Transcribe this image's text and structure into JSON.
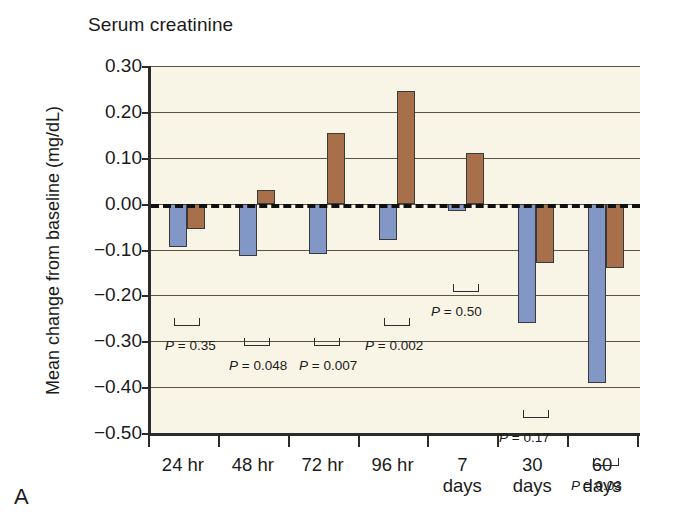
{
  "figure": {
    "panel_letter": "A",
    "title": "Serum creatinine",
    "ylabel": "Mean change from baseline (mg/dL)"
  },
  "colors": {
    "series_blue": "#8397c6",
    "series_brown": "#a8704a",
    "plot_background": "#f8f5e6",
    "axis": "#2b2b2b",
    "gridline": "#5c5243"
  },
  "chart_data": {
    "type": "bar",
    "title": "Serum creatinine",
    "xlabel": "",
    "ylabel": "Mean change from baseline (mg/dL)",
    "ylim": [
      -0.5,
      0.3
    ],
    "yticks": [
      "0.30",
      "0.20",
      "0.10",
      "0.00",
      "−0.10",
      "−0.20",
      "−0.30",
      "−0.40",
      "−0.50"
    ],
    "ytick_values": [
      0.3,
      0.2,
      0.1,
      0.0,
      -0.1,
      -0.2,
      -0.3,
      -0.4,
      -0.5
    ],
    "grid": true,
    "zero_reference_line": 0.0,
    "legend_position": "none",
    "categories": [
      "24 hr",
      "48 hr",
      "72 hr",
      "96 hr",
      "7 days",
      "30 days",
      "60 days"
    ],
    "series": [
      {
        "name": "series-blue",
        "values": [
          -0.095,
          -0.115,
          -0.11,
          -0.08,
          -0.015,
          -0.26,
          -0.39
        ]
      },
      {
        "name": "series-brown",
        "values": [
          -0.055,
          0.03,
          0.155,
          0.245,
          0.11,
          -0.13,
          -0.14
        ]
      }
    ],
    "annotations": [
      {
        "category": "24 hr",
        "text": "P = 0.35",
        "p_value": "0.35"
      },
      {
        "category": "48 hr",
        "text": "P = 0.048",
        "p_value": "0.048"
      },
      {
        "category": "72 hr",
        "text": "P = 0.007",
        "p_value": "0.007"
      },
      {
        "category": "96 hr",
        "text": "P = 0.002",
        "p_value": "0.002"
      },
      {
        "category": "7 days",
        "text": "P = 0.50",
        "p_value": "0.50"
      },
      {
        "category": "30 days",
        "text": "P = 0.17",
        "p_value": "0.17"
      },
      {
        "category": "60 days",
        "text": "P = 0.03",
        "p_value": "0.03"
      }
    ]
  },
  "ytick_labels": [
    "0.30",
    "0.20",
    "0.10",
    "0.00",
    "−0.10",
    "−0.20",
    "−0.30",
    "−0.40",
    "−0.50"
  ],
  "xcats": [
    {
      "line1": "24 hr",
      "line2": ""
    },
    {
      "line1": "48 hr",
      "line2": ""
    },
    {
      "line1": "72 hr",
      "line2": ""
    },
    {
      "line1": "96 hr",
      "line2": ""
    },
    {
      "line1": "7",
      "line2": "days"
    },
    {
      "line1": "30",
      "line2": "days"
    },
    {
      "line1": "60",
      "line2": "days"
    }
  ],
  "pvalues": [
    {
      "italic": "P",
      "rest": " = 0.35"
    },
    {
      "italic": "P",
      "rest": " = 0.048"
    },
    {
      "italic": "P",
      "rest": " = 0.007"
    },
    {
      "italic": "P",
      "rest": " = 0.002"
    },
    {
      "italic": "P",
      "rest": " = 0.50"
    },
    {
      "italic": "P",
      "rest": " = 0.17"
    },
    {
      "italic": "P",
      "rest": " = 0.03"
    }
  ]
}
